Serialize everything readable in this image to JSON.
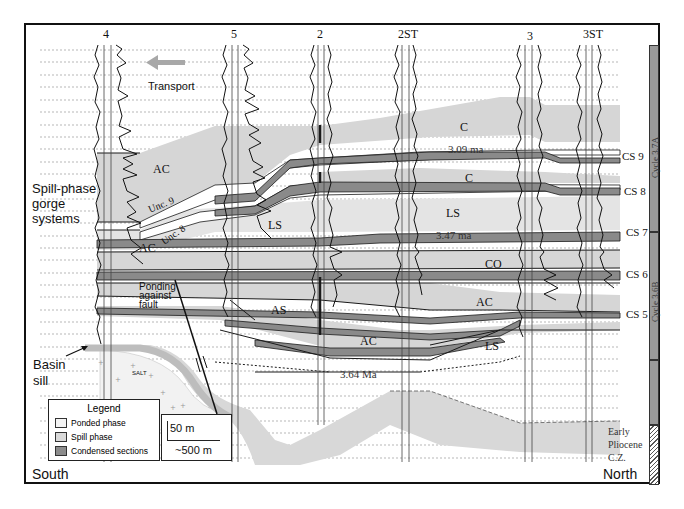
{
  "figure": {
    "orientation": {
      "left": "South",
      "right": "North"
    },
    "wells": [
      {
        "label": "4",
        "x": 107
      },
      {
        "label": "5",
        "x": 234
      },
      {
        "label": "2",
        "x": 321
      },
      {
        "label": "2ST",
        "x": 409
      },
      {
        "label": "3",
        "x": 529
      },
      {
        "label": "3ST",
        "x": 593
      }
    ],
    "annotations": {
      "transport": "Transport",
      "spill_phase": [
        "Spill-phase",
        "gorge",
        "systems"
      ],
      "basin_sill": [
        "Basin",
        "sill"
      ],
      "ponding": [
        "Ponding",
        "against",
        "fault"
      ],
      "salt": "SALT",
      "unc9": "Unc. 9",
      "unc8": "Unc. 8",
      "early_pliocene": [
        "Early",
        "Pliocene",
        "C.Z."
      ]
    },
    "units": [
      {
        "label": "C",
        "x": 460,
        "y": 127
      },
      {
        "label": "C",
        "x": 465,
        "y": 178
      },
      {
        "label": "AC",
        "x": 150,
        "y": 170
      },
      {
        "label": "AC",
        "x": 140,
        "y": 246
      },
      {
        "label": "LS",
        "x": 270,
        "y": 226
      },
      {
        "label": "LS",
        "x": 450,
        "y": 213
      },
      {
        "label": "CO",
        "x": 485,
        "y": 264
      },
      {
        "label": "AC",
        "x": 476,
        "y": 302
      },
      {
        "label": "AS",
        "x": 276,
        "y": 311
      },
      {
        "label": "AC",
        "x": 362,
        "y": 342
      },
      {
        "label": "LS",
        "x": 485,
        "y": 346
      }
    ],
    "ages": [
      {
        "label": "3.09 ma",
        "x": 460,
        "y": 149
      },
      {
        "label": "3.47 ma",
        "x": 438,
        "y": 236
      },
      {
        "label": "3.64 Ma",
        "x": 342,
        "y": 374
      }
    ],
    "condensed_sections": [
      {
        "label": "CS 9",
        "y": 157
      },
      {
        "label": "CS 8",
        "y": 192
      },
      {
        "label": "CS 7",
        "y": 233
      },
      {
        "label": "CS 6",
        "y": 275
      },
      {
        "label": "CS 5",
        "y": 315
      }
    ],
    "cycles": [
      {
        "label": "Cycle 3.7A",
        "top": 0,
        "height": 187,
        "fill": "#9a9a9a"
      },
      {
        "label": "Cycle 3.6B",
        "top": 187,
        "height": 128,
        "fill": "#9a9a9a"
      },
      {
        "label": "",
        "top": 315,
        "height": 65,
        "fill": "#9a9a9a"
      },
      {
        "label": "",
        "top": 380,
        "height": 60,
        "fill": "hatch"
      }
    ],
    "legend": {
      "title": "Legend",
      "items": [
        {
          "label": "Ponded phase",
          "color": "#f4f4f4"
        },
        {
          "label": "Spill phase",
          "color": "#d9d9d9"
        },
        {
          "label": "Condensed sections",
          "color": "#8c8c8c"
        }
      ]
    },
    "scale": {
      "vertical": "50 m",
      "horizontal": "~500 m"
    },
    "colors": {
      "ponded": "#f4f4f4",
      "spill": "#d6d6d6",
      "condensed": "#8a8a8a",
      "arrow": "#a8a8a8",
      "line": "#1a1a1a"
    }
  }
}
